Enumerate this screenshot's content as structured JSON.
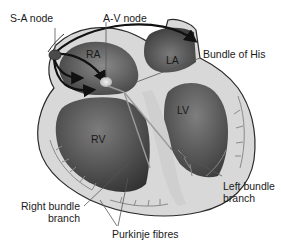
{
  "diagram": {
    "labels": {
      "sa_node": "S-A node",
      "av_node": "A-V node",
      "bundle_of_his": "Bundle of His",
      "right_bundle_line1": "Right bundle",
      "right_bundle_line2": "branch",
      "left_bundle_line1": "Left bundle",
      "left_bundle_line2": "branch",
      "purkinje": "Purkinje fibres"
    },
    "chambers": {
      "ra": "RA",
      "la": "LA",
      "rv": "RV",
      "lv": "LV"
    },
    "colors": {
      "wall": "#d6d6d6",
      "chamber_dark": "#3c3c3c",
      "chamber_mid": "#6e6e6e",
      "outline": "#2a2a2a",
      "node": "#4a4a4a",
      "fibres": "#8a8a8a",
      "arrows": "#111111"
    }
  }
}
